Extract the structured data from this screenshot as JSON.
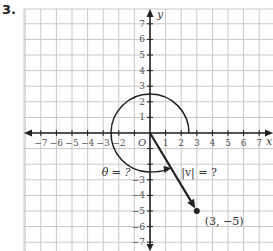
{
  "problem_number": "3.",
  "axes": {
    "x_label": "x",
    "y_label": "y",
    "origin_label": "O",
    "x_ticks": [
      "−7",
      "−6",
      "−5",
      "−4",
      "−3",
      "−2",
      "1",
      "2",
      "3",
      "4",
      "5",
      "6",
      "7"
    ],
    "y_ticks_pos": [
      "1",
      "2",
      "3",
      "4",
      "5",
      "6",
      "7"
    ],
    "y_ticks_neg": [
      "−3",
      "−4",
      "−5",
      "−6",
      "−7"
    ],
    "range": {
      "x": [
        -7,
        7
      ],
      "y": [
        -7,
        7
      ]
    }
  },
  "vector": {
    "from": [
      0,
      0
    ],
    "to": [
      3,
      -5
    ],
    "point_label": "(3, −5)",
    "magnitude_label": "|v| = ?"
  },
  "angle": {
    "label": "θ = ?",
    "arc_radius": 2.5
  },
  "colors": {
    "grid": "#c8c8c8",
    "ink": "#222222"
  }
}
